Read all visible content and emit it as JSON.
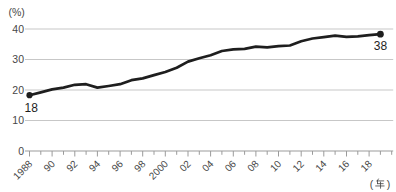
{
  "chart_data": {
    "type": "line",
    "title": "",
    "y_unit_label": "(%)",
    "x_unit_label": "(年)",
    "xlim": [
      1988,
      2020
    ],
    "ylim": [
      0,
      40
    ],
    "y_ticks": [
      0,
      10,
      20,
      30,
      40
    ],
    "x_tick_label_years": [
      1988,
      1990,
      1992,
      1994,
      1996,
      1998,
      2000,
      2002,
      2004,
      2006,
      2008,
      2010,
      2012,
      2014,
      2016,
      2018
    ],
    "x_tick_labels": [
      "1988",
      "90",
      "92",
      "94",
      "96",
      "98",
      "2000",
      "02",
      "04",
      "06",
      "08",
      "10",
      "12",
      "14",
      "16",
      "18"
    ],
    "x": [
      1988,
      1989,
      1990,
      1991,
      1992,
      1993,
      1994,
      1995,
      1996,
      1997,
      1998,
      1999,
      2000,
      2001,
      2002,
      2003,
      2004,
      2005,
      2006,
      2007,
      2008,
      2009,
      2010,
      2011,
      2012,
      2013,
      2014,
      2015,
      2016,
      2017,
      2018,
      2019
    ],
    "values": [
      18.3,
      19.2,
      20.2,
      20.8,
      21.7,
      21.9,
      20.8,
      21.3,
      21.9,
      23.2,
      23.8,
      24.9,
      25.9,
      27.3,
      29.3,
      30.4,
      31.4,
      32.8,
      33.3,
      33.5,
      34.2,
      34.0,
      34.4,
      34.6,
      36.0,
      36.9,
      37.3,
      37.8,
      37.4,
      37.6,
      38.0,
      38.3
    ],
    "point_labels": {
      "start": "18",
      "end": "38"
    },
    "grid": "horizontal-only",
    "legend": "none",
    "colors": {
      "line": "#1e1e1e",
      "point": "#1e1e1e",
      "grid": "#c7c7c7",
      "axis": "#9b9b9b",
      "tick_label": "#474747",
      "annotation": "#1e1e1e"
    }
  }
}
